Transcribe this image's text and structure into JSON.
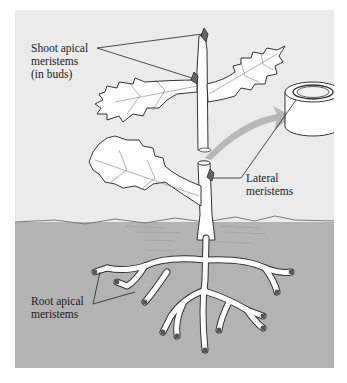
{
  "figure": {
    "type": "plant-meristems-diagram",
    "colors": {
      "sky_background": "#ebebeb",
      "soil": "#b3b3b3",
      "plant_fill": "#ffffff",
      "outline": "#333333",
      "meristem_tip": "#555555",
      "arrow": "#b8b8b8"
    },
    "labels": {
      "shoot": {
        "line1": "Shoot apical",
        "line2": "meristems",
        "line3": "(in buds)"
      },
      "lateral": {
        "line1": "Lateral",
        "line2": "meristems"
      },
      "root": {
        "line1": "Root apical",
        "line2": "meristems"
      }
    },
    "icons": {
      "cylinder": "stem-cross-section-cylinder",
      "arrow": "magnify-arrow"
    }
  }
}
